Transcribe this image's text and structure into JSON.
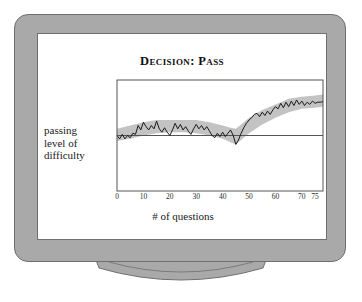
{
  "page_header": {
    "left_fragment": "",
    "right_fragment": ""
  },
  "figure": {
    "device": "computer-monitor",
    "screen_background": "#ffffff",
    "bezel_color": "#a9a9a9",
    "outline_color": "#6f6f6f"
  },
  "chart_data": {
    "type": "line",
    "title": "Decision: Pass",
    "xlabel": "# of questions",
    "ylabel_lines": [
      "passing",
      "level of",
      "difficulty"
    ],
    "ylabel": "passing level of difficulty",
    "grid": false,
    "legend": "none",
    "xlim": [
      0,
      78
    ],
    "ylim": [
      0,
      10
    ],
    "xticks": [
      0,
      10,
      20,
      30,
      40,
      50,
      60,
      70,
      75
    ],
    "xtick_labels": [
      "0",
      "10",
      "20",
      "30",
      "40",
      "50",
      "60",
      "70",
      "75"
    ],
    "yticks": [],
    "ytick_labels": [],
    "reference_line": {
      "name": "passing-level-of-difficulty-line",
      "orientation": "horizontal",
      "y": 5.0,
      "color": "#555555"
    },
    "series": [
      {
        "name": "ability estimate",
        "type": "line",
        "color": "#1a1a1a",
        "x": [
          0,
          1,
          2,
          3,
          4,
          5,
          6,
          7,
          8,
          9,
          10,
          11,
          12,
          13,
          14,
          15,
          16,
          17,
          18,
          19,
          20,
          21,
          22,
          23,
          24,
          25,
          26,
          27,
          28,
          29,
          30,
          31,
          32,
          33,
          34,
          35,
          36,
          37,
          38,
          39,
          40,
          41,
          42,
          43,
          44,
          45,
          46,
          47,
          48,
          49,
          50,
          51,
          52,
          53,
          54,
          55,
          56,
          57,
          58,
          59,
          60,
          61,
          62,
          63,
          64,
          65,
          66,
          67,
          68,
          69,
          70,
          71,
          72,
          73,
          74,
          75,
          76,
          77,
          78
        ],
        "y": [
          5.0,
          4.7,
          5.1,
          4.7,
          5.0,
          4.8,
          5.2,
          5.1,
          5.9,
          5.5,
          6.2,
          5.8,
          5.5,
          5.9,
          5.6,
          6.3,
          5.6,
          5.3,
          5.7,
          5.3,
          5.0,
          5.5,
          6.1,
          5.6,
          6.0,
          5.5,
          5.8,
          5.4,
          5.1,
          5.6,
          6.0,
          5.6,
          5.9,
          5.5,
          5.8,
          5.4,
          5.0,
          4.8,
          5.2,
          4.9,
          5.3,
          4.9,
          5.2,
          5.5,
          5.0,
          4.2,
          4.6,
          5.2,
          5.7,
          6.1,
          6.4,
          6.6,
          6.9,
          7.0,
          6.7,
          7.1,
          6.8,
          7.2,
          6.9,
          7.3,
          7.6,
          7.4,
          7.9,
          7.5,
          8.0,
          7.6,
          8.1,
          7.7,
          8.2,
          7.8,
          8.1,
          7.7,
          8.0,
          7.8,
          8.1,
          7.9,
          8.0,
          8.0,
          8.05
        ]
      }
    ],
    "band": {
      "name": "confidence-band",
      "color": "#b8b8b8",
      "opacity": 0.85,
      "x": [
        0,
        5,
        10,
        15,
        20,
        25,
        30,
        35,
        40,
        43,
        45,
        47,
        50,
        55,
        60,
        65,
        70,
        75,
        78
      ],
      "upper": [
        5.6,
        5.9,
        6.2,
        6.4,
        6.4,
        6.4,
        6.4,
        6.2,
        5.9,
        5.7,
        5.6,
        6.0,
        6.6,
        7.3,
        7.8,
        8.3,
        8.5,
        8.6,
        8.7
      ],
      "lower": [
        4.5,
        4.7,
        5.0,
        5.2,
        5.3,
        5.3,
        5.2,
        5.0,
        4.7,
        4.4,
        4.2,
        4.6,
        5.2,
        6.0,
        6.6,
        7.1,
        7.4,
        7.5,
        7.6
      ]
    }
  }
}
